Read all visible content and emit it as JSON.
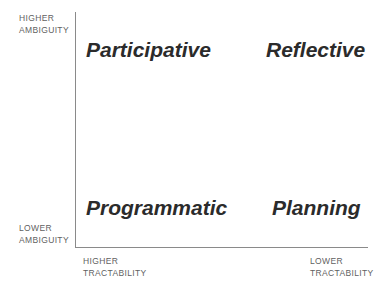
{
  "diagram": {
    "type": "2x2-matrix",
    "axes": {
      "y": {
        "name": "ambiguity",
        "high_label_line1": "HIGHER",
        "high_label_line2": "AMBIGUITY",
        "low_label_line1": "LOWER",
        "low_label_line2": "AMBIGUITY"
      },
      "x": {
        "name": "tractability",
        "left_label_line1": "HIGHER",
        "left_label_line2": "TRACTABILITY",
        "right_label_line1": "LOWER",
        "right_label_line2": "TRACTABILITY"
      }
    },
    "quadrants": {
      "top_left": "Participative",
      "top_right": "Reflective",
      "bottom_left": "Programmatic",
      "bottom_right": "Planning"
    },
    "colors": {
      "axis": "#8a8a8a",
      "axis_label_text": "#5f5f5f",
      "quadrant_text": "#2b2b2b",
      "background": "#ffffff"
    }
  }
}
